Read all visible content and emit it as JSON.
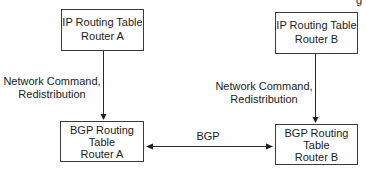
{
  "diagram": {
    "corner_fragment": "g",
    "nodes": {
      "ip_a": {
        "lines": [
          "IP Routing Table",
          "Router A"
        ]
      },
      "ip_b": {
        "lines": [
          "IP Routing Table",
          "Router B"
        ]
      },
      "bgp_a": {
        "lines": [
          "BGP Routing",
          "Table",
          "Router A"
        ]
      },
      "bgp_b": {
        "lines": [
          "BGP Routing",
          "Table",
          "Router B"
        ]
      }
    },
    "edges": {
      "ip_a_to_bgp_a": {
        "label_lines": [
          "Network Command,",
          "Redistribution"
        ],
        "direction": "down"
      },
      "ip_b_to_bgp_b": {
        "label_lines": [
          "Network Command,",
          "Redistribution"
        ],
        "direction": "down"
      },
      "bgp_a_bgp_b": {
        "label": "BGP",
        "direction": "bidirectional"
      }
    }
  }
}
